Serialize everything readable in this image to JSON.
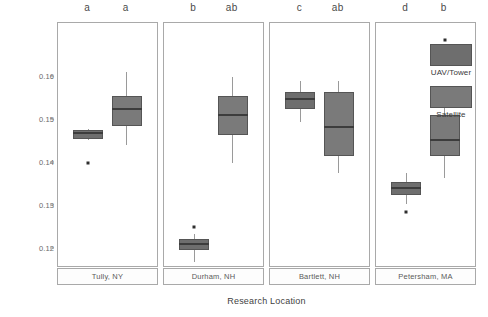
{
  "chart_data": {
    "type": "box",
    "title": "",
    "xlabel": "Research Location",
    "ylabel": "Albedo (0-1)",
    "ylim": [
      0.1155,
      0.1725
    ],
    "yticks": [
      0.12,
      0.13,
      0.14,
      0.15,
      0.16
    ],
    "ytick_labels": [
      "0.12",
      "0.13",
      "0.14",
      "0.15",
      "0.16"
    ],
    "grid": false,
    "legend_position": "right",
    "categories": [
      "Tully, NY",
      "Durham, NH",
      "Bartlett, NH",
      "Petersham, MA"
    ],
    "series": [
      {
        "name": "UAV/Tower",
        "color": "#6e6e6e",
        "boxes": [
          {
            "category": "Tully, NY",
            "letter": "a",
            "whisker_low": 0.1452,
            "q1": 0.1455,
            "median": 0.1468,
            "q3": 0.1475,
            "whisker_high": 0.1478,
            "outliers": [
              0.14
            ]
          },
          {
            "category": "Durham, NH",
            "letter": "b",
            "whisker_low": 0.117,
            "q1": 0.1198,
            "median": 0.1212,
            "q3": 0.1222,
            "whisker_high": 0.1235,
            "outliers": [
              0.125
            ]
          },
          {
            "category": "Bartlett, NH",
            "letter": "c",
            "whisker_low": 0.1495,
            "q1": 0.1525,
            "median": 0.1548,
            "q3": 0.1565,
            "whisker_high": 0.159,
            "outliers": []
          },
          {
            "category": "Petersham, MA",
            "letter": "d",
            "whisker_low": 0.1305,
            "q1": 0.1325,
            "median": 0.134,
            "q3": 0.1355,
            "whisker_high": 0.1375,
            "outliers": [
              0.1285
            ]
          }
        ]
      },
      {
        "name": "Satellite",
        "color": "#7a7a7a",
        "boxes": [
          {
            "category": "Tully, NY",
            "letter": "a",
            "whisker_low": 0.144,
            "q1": 0.1485,
            "median": 0.1525,
            "q3": 0.1555,
            "whisker_high": 0.161,
            "outliers": []
          },
          {
            "category": "Durham, NH",
            "letter": "ab",
            "whisker_low": 0.14,
            "q1": 0.1465,
            "median": 0.1512,
            "q3": 0.1555,
            "whisker_high": 0.16,
            "outliers": []
          },
          {
            "category": "Bartlett, NH",
            "letter": "ab",
            "whisker_low": 0.1375,
            "q1": 0.1415,
            "median": 0.1482,
            "q3": 0.1565,
            "whisker_high": 0.159,
            "outliers": []
          },
          {
            "category": "Petersham, MA",
            "letter": "b",
            "whisker_low": 0.1365,
            "q1": 0.1415,
            "median": 0.1452,
            "q3": 0.151,
            "whisker_high": 0.1555,
            "outliers": [
              0.1685
            ]
          }
        ]
      }
    ],
    "legend": [
      {
        "label": "UAV/Tower",
        "color": "#6e6e6e"
      },
      {
        "label": "Satellite",
        "color": "#7a7a7a"
      }
    ]
  }
}
